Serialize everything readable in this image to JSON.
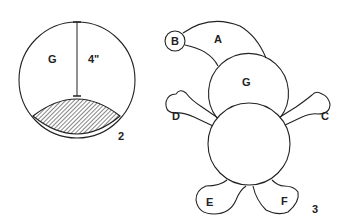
{
  "figure2": {
    "number": "2",
    "circle_label": "G",
    "dimension_label": "4\"",
    "shaded_region": "hatched bottom segment"
  },
  "figure3": {
    "number": "3",
    "labels": {
      "a": "A",
      "b": "B",
      "c": "C",
      "d": "D",
      "e": "E",
      "f": "F",
      "g": "G"
    }
  }
}
